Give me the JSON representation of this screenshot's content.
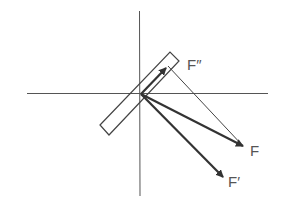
{
  "diagram": {
    "colors": {
      "axis": "#555555",
      "vector": "#333333",
      "construction": "#444444",
      "bar_outline": "#444444",
      "label": "#555555"
    },
    "origin": [
      140,
      94
    ],
    "axes": {
      "horizontal": {
        "x1": 27,
        "y1": 93,
        "x2": 268,
        "y2": 93
      },
      "vertical": {
        "x1": 139,
        "y1": 11,
        "x2": 140,
        "y2": 196
      }
    },
    "bar": {
      "corners": [
        [
          100,
          125
        ],
        [
          170,
          52
        ],
        [
          179,
          61
        ],
        [
          109,
          135
        ]
      ]
    },
    "vectors": [
      {
        "id": "F",
        "label": "F",
        "tip": [
          243,
          146
        ]
      },
      {
        "id": "F-prime",
        "label": "F′",
        "tip": [
          223,
          177
        ]
      },
      {
        "id": "F-double-prime",
        "label": "F″",
        "tip": [
          166,
          68
        ]
      }
    ],
    "construction_line": {
      "from": [
        168,
        66
      ],
      "to": [
        243,
        146
      ]
    },
    "labels": {
      "F": "F",
      "F_prime": "F′",
      "F_double_prime": "F″"
    }
  }
}
